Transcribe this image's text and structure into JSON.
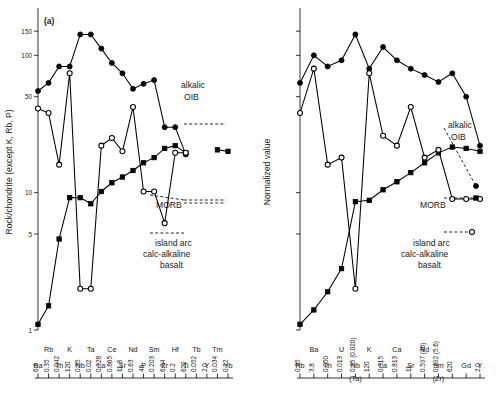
{
  "figure": {
    "panel_a_tag": "(a)",
    "legend": {
      "oib_line1": "alkalic",
      "oib_line2": "OIB",
      "morb": "MORB",
      "arc_line1": "island arc",
      "arc_line2": "calc-alkaline",
      "arc_line3": "basalt"
    }
  },
  "chart_data": [
    {
      "type": "line",
      "panel": "a",
      "title": "(a)",
      "ylabel": "Rock/chondrite (except K, Rb, P)",
      "xlabel": "",
      "yscale": "log",
      "ylim": [
        1,
        200
      ],
      "yticks": [
        1,
        5,
        10,
        50,
        100,
        150
      ],
      "ytick_labels": [
        "1",
        "5",
        "10",
        "50",
        "100",
        "150"
      ],
      "grid": false,
      "legend_position": "inside-right",
      "categories": [
        "Ba",
        "Rb",
        "Th",
        "K",
        "Nb",
        "Ta",
        "La",
        "Ce",
        "Sr",
        "Nd",
        "P",
        "Sm",
        "Zr",
        "Hf",
        "Ti",
        "Tb",
        "Y",
        "Tm",
        "Yb"
      ],
      "normalizing_values": [
        "6.9",
        "0.35",
        "0.042",
        "120",
        "0.35",
        "0.02",
        "0.328",
        "0.865",
        "11.8",
        "0.63",
        "46",
        "0.203",
        "6.84",
        "0.2",
        "620",
        "0.052",
        "2.0",
        "0.034",
        "0.22"
      ],
      "category_rows": {
        "upper": [
          "",
          "Rb",
          "",
          "K",
          "",
          "Ta",
          "",
          "Ce",
          "",
          "Nd",
          "",
          "Sm",
          "",
          "Hf",
          "",
          "Tb",
          "",
          "Tm",
          ""
        ],
        "lower": [
          "Ba",
          "",
          "Th",
          "",
          "Nb",
          "",
          "La",
          "",
          "Sr",
          "",
          "P",
          "",
          "Zr",
          "",
          "Ti",
          "",
          "Y",
          "",
          "Yb"
        ]
      },
      "series": [
        {
          "name": "alkalic OIB",
          "marker": "filled-circle",
          "linestyle": "solid",
          "values": [
            55,
            63,
            83,
            83,
            142,
            142,
            112,
            88,
            74,
            57,
            62,
            66,
            30,
            30,
            19,
            null,
            null,
            null,
            null
          ]
        },
        {
          "name": "MORB",
          "marker": "filled-square",
          "linestyle": "solid",
          "values": [
            1.1,
            1.5,
            4.6,
            9.2,
            9.2,
            8.3,
            10.2,
            11.8,
            13.0,
            14.5,
            16.5,
            18.0,
            21.0,
            22.0,
            19.5,
            null,
            null,
            20.5,
            20.0
          ]
        },
        {
          "name": "island arc calc-alkaline basalt",
          "marker": "open-circle",
          "linestyle": "solid",
          "values": [
            41,
            38,
            16,
            74,
            2.0,
            2.0,
            22,
            25,
            20,
            42,
            10.2,
            10.2,
            6.0,
            19.5,
            19.5,
            null,
            null,
            null,
            null
          ]
        }
      ]
    },
    {
      "type": "line",
      "panel": "b",
      "title": "",
      "ylabel": "Normalized value",
      "xlabel": "",
      "yscale": "log",
      "ylim": [
        1,
        200
      ],
      "yticks": [
        1,
        5,
        10,
        50,
        100,
        150
      ],
      "ytick_labels": [
        "",
        "",
        "",
        "",
        "",
        ""
      ],
      "grid": false,
      "legend_position": "inside-right",
      "categories": [
        "Rb",
        "Ba",
        "Th",
        "U",
        "Nb",
        "K",
        "La",
        "Ce",
        "Sr",
        "Nd",
        "Sm",
        "Zr",
        "Gd",
        "Y"
      ],
      "normalizing_values": [
        "0.35",
        "3.8",
        "0.050",
        "0.013",
        "0.35 (0.020)",
        "120",
        "0.315",
        "0.813",
        "11",
        "0.597 (46)",
        "0.192 (5.6)",
        "620",
        "",
        "2.0"
      ],
      "category_rows": {
        "upper": [
          "",
          "Ba",
          "",
          "U",
          "",
          "K",
          "",
          "Ca",
          "",
          "Nd",
          "",
          "",
          "",
          ""
        ],
        "lower": [
          "Rb",
          "",
          "Th",
          "",
          "Nb",
          "",
          "La",
          "",
          "Sr",
          "",
          "Sm",
          "",
          "Gd",
          "Y"
        ],
        "lower_sub": [
          "",
          "",
          "",
          "",
          "(Ta)",
          "",
          "",
          "",
          "",
          "",
          "(Zr)",
          "",
          "",
          ""
        ]
      },
      "series": [
        {
          "name": "alkalic OIB",
          "marker": "filled-circle",
          "linestyle": "solid",
          "values": [
            63,
            100,
            83,
            92,
            142,
            80,
            115,
            92,
            80,
            72,
            64,
            74,
            50,
            22
          ]
        },
        {
          "name": "MORB",
          "marker": "filled-square",
          "linestyle": "solid",
          "values": [
            1.1,
            1.4,
            1.9,
            2.8,
            8.6,
            8.8,
            10.5,
            12.0,
            14.0,
            16.5,
            19.5,
            21.5,
            21.0,
            20.0
          ]
        },
        {
          "name": "island arc calc-alkaline basalt",
          "marker": "open-circle",
          "linestyle": "solid",
          "values": [
            38,
            80,
            16,
            18,
            2.0,
            74,
            26,
            22,
            42,
            18,
            20.5,
            9.0,
            9.0,
            9.0
          ]
        }
      ]
    }
  ]
}
